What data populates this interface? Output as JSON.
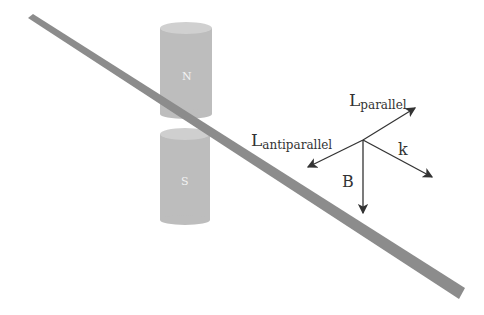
{
  "diagram": {
    "magnets": {
      "north_label": "N",
      "south_label": "S",
      "color": "#bcbcbc"
    },
    "sample_bar": {
      "color": "#8a8a8a"
    },
    "vectors": {
      "l_parallel": {
        "main": "L",
        "sub": "parallel"
      },
      "l_antiparallel": {
        "main": "L",
        "sub": "antiparallel"
      },
      "k": "k",
      "b": "B",
      "color": "#333333"
    }
  }
}
